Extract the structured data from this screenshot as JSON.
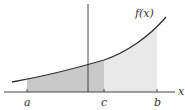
{
  "diagram": {
    "type": "area-under-curve",
    "function_label": "f(x)",
    "x_axis_label": "x",
    "points": [
      {
        "name": "a",
        "label": "a",
        "x": 27
      },
      {
        "name": "c",
        "label": "c",
        "x": 104
      },
      {
        "name": "b",
        "label": "b",
        "x": 157
      }
    ],
    "regions": [
      {
        "name": "region-a-to-c",
        "from": "a",
        "to": "c",
        "color": "#c9c9c9"
      },
      {
        "name": "region-c-to-b",
        "from": "c",
        "to": "b",
        "color": "#e9e9e9"
      }
    ],
    "colors": {
      "curve": "#333333",
      "axis": "#444444",
      "dark_shade": "#c9c9c9",
      "light_shade": "#e9e9e9"
    }
  }
}
